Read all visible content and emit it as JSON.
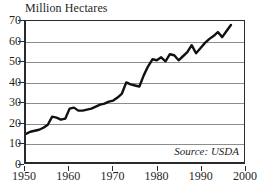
{
  "chart_data": {
    "type": "line",
    "title": "Million Hectares",
    "xlabel": "",
    "ylabel": "",
    "ylim": [
      0,
      70
    ],
    "xlim": [
      1950,
      2000
    ],
    "yticks": [
      0,
      10,
      20,
      30,
      40,
      50,
      60,
      70
    ],
    "xticks": [
      1950,
      1960,
      1970,
      1980,
      1990,
      2000
    ],
    "grid": "horizontal",
    "legend": "none",
    "annotations": [
      "Source: USDA"
    ],
    "line_color": "#111111",
    "grid_color": "#8c8c8c",
    "axis_color": "#2a2a2a",
    "series": [
      {
        "name": "Area",
        "x": [
          1950,
          1951,
          1952,
          1953,
          1954,
          1955,
          1956,
          1957,
          1958,
          1959,
          1960,
          1961,
          1962,
          1963,
          1964,
          1965,
          1966,
          1967,
          1968,
          1969,
          1970,
          1971,
          1972,
          1973,
          1974,
          1975,
          1976,
          1977,
          1978,
          1979,
          1980,
          1981,
          1982,
          1983,
          1984,
          1985,
          1986,
          1987,
          1988,
          1989,
          1990,
          1991,
          1992,
          1993,
          1994,
          1995,
          1996,
          1997
        ],
        "values": [
          14,
          15,
          15.5,
          16,
          17,
          18.5,
          22.5,
          22,
          21,
          21.5,
          26.5,
          27,
          25.5,
          25.5,
          26,
          26.5,
          27.5,
          28.5,
          29,
          30,
          30.5,
          32,
          34,
          39.5,
          38.5,
          38,
          37.5,
          43,
          47.5,
          51,
          50.5,
          52,
          50,
          53.5,
          53,
          50.5,
          52.5,
          54.5,
          58,
          54,
          56.5,
          59,
          61,
          62.5,
          64.5,
          62,
          65,
          68
        ]
      }
    ]
  },
  "source_note": "Source: USDA",
  "y_axis": {
    "labels": [
      "70",
      "60",
      "50",
      "40",
      "30",
      "20",
      "10",
      "0"
    ]
  },
  "x_axis": {
    "labels": [
      "1950",
      "1960",
      "1970",
      "1980",
      "1990",
      "2000"
    ]
  }
}
